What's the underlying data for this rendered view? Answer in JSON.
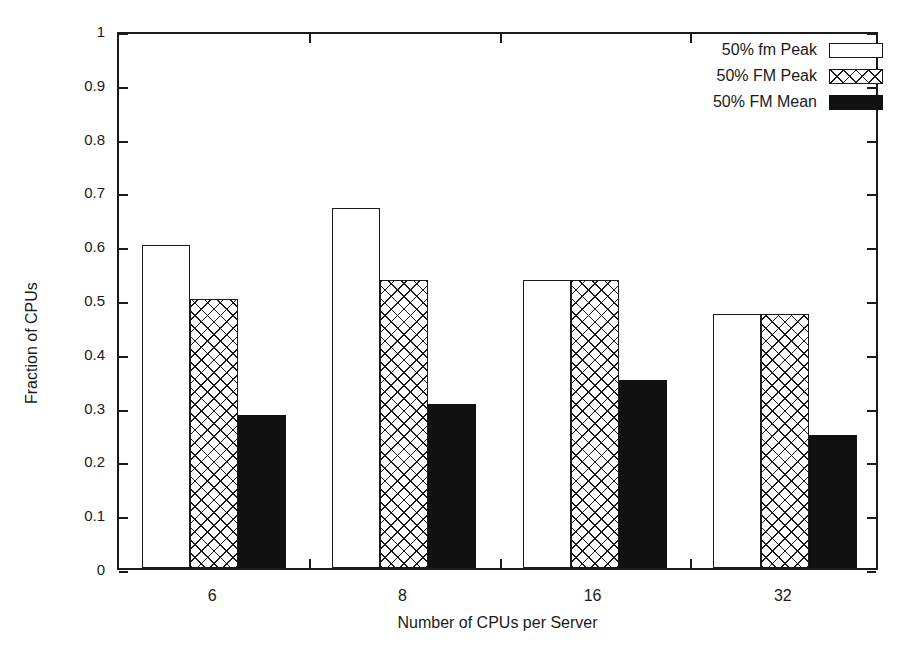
{
  "chart_data": {
    "type": "bar",
    "title": "",
    "xlabel": "Number of CPUs per Server",
    "ylabel": "Fraction of CPUs",
    "categories": [
      "6",
      "8",
      "16",
      "32"
    ],
    "ylim": [
      0,
      1
    ],
    "yticks": [
      0,
      0.1,
      0.2,
      0.3,
      0.4,
      0.5,
      0.6,
      0.7,
      0.8,
      0.9,
      1
    ],
    "ytick_labels": [
      "0",
      "0.1",
      "0.2",
      "0.3",
      "0.4",
      "0.5",
      "0.6",
      "0.7",
      "0.8",
      "0.9",
      "1"
    ],
    "grid": false,
    "legend_position": "top-right",
    "series": [
      {
        "name": "50% fm Peak",
        "fill": "empty",
        "values": [
          0.6,
          0.67,
          0.535,
          0.472
        ]
      },
      {
        "name": "50% FM Peak",
        "fill": "crosshatch",
        "values": [
          0.5,
          0.535,
          0.535,
          0.472
        ]
      },
      {
        "name": "50% FM Mean",
        "fill": "solid",
        "values": [
          0.285,
          0.305,
          0.35,
          0.248
        ]
      }
    ]
  },
  "legend": {
    "items": [
      {
        "label": "50% fm Peak",
        "fill": "empty"
      },
      {
        "label": "50% FM Peak",
        "fill": "crosshatch"
      },
      {
        "label": "50% FM Mean",
        "fill": "solid"
      }
    ]
  },
  "colors": {
    "axis": "#1a1a1a",
    "bar_outline": "#1a1a1a",
    "bar_solid": "#111111",
    "background": "#ffffff"
  }
}
